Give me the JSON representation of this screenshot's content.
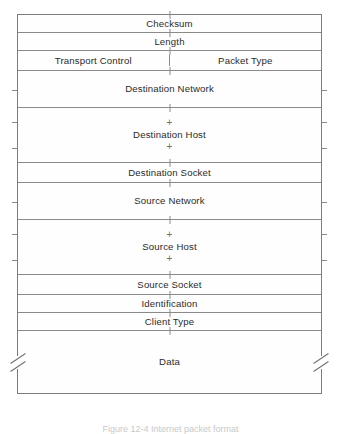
{
  "figure": {
    "caption": "Figure 12-4  Internet packet format",
    "line_color": "#8a8a8a",
    "text_color": "#2b2b2b",
    "background": "#ffffff"
  },
  "packet": {
    "title": "Internet packet format",
    "fields": [
      {
        "label": "Checksum",
        "kind": "single",
        "height": 18
      },
      {
        "label": "Length",
        "kind": "single",
        "height": 18
      },
      {
        "label": "Transport Control",
        "kind": "split-left",
        "height": 20
      },
      {
        "label": "Packet Type",
        "kind": "split-right",
        "height": 20
      },
      {
        "label": "Destination Network",
        "kind": "tall",
        "height": 37
      },
      {
        "label": "Destination Host",
        "kind": "stacked",
        "height": 55
      },
      {
        "label": "Destination Socket",
        "kind": "single",
        "height": 20
      },
      {
        "label": "Source Network",
        "kind": "tall",
        "height": 37
      },
      {
        "label": "Source Host",
        "kind": "stacked",
        "height": 55
      },
      {
        "label": "Source Socket",
        "kind": "single",
        "height": 20
      },
      {
        "label": "Identification",
        "kind": "single",
        "height": 18
      },
      {
        "label": "Client Type",
        "kind": "single",
        "height": 18
      },
      {
        "label": "Data",
        "kind": "data",
        "height": 62
      }
    ],
    "continuation_glyph": "+"
  }
}
